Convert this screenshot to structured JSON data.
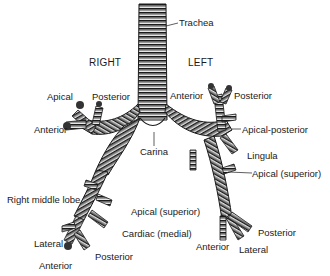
{
  "diagram": {
    "sides": {
      "right": "RIGHT",
      "left": "LEFT"
    },
    "labels": {
      "trachea": "Trachea",
      "carina": "Carina",
      "right_apical": "Apical",
      "right_posterior": "Posterior",
      "right_anterior": "Anterior",
      "right_middle_lobe": "Right middle lobe",
      "right_apical_superior": "Apical (superior)",
      "right_cardiac_medial": "Cardiac (medial)",
      "right_lateral": "Lateral",
      "right_posterior_basal": "Posterior",
      "right_anterior_basal": "Anterior",
      "left_anterior": "Anterior",
      "left_posterior": "Posterior",
      "left_apical_posterior": "Apical-posterior",
      "left_lingula": "Lingula",
      "left_apical_superior": "Apical (superior)",
      "left_posterior_basal": "Posterior",
      "left_anterior_basal": "Anterior",
      "left_lateral_basal": "Lateral"
    },
    "colors": {
      "ink": "#1a1a1a",
      "shade": "#555555",
      "highlight": "#e6e6e6",
      "background": "#ffffff"
    }
  }
}
